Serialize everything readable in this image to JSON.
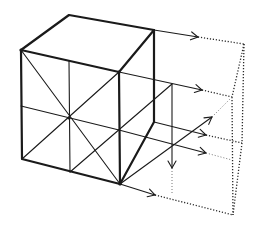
{
  "figure": {
    "ink_color": "#1a1a1a",
    "background": "#ffffff",
    "parts": {
      "cube": "solid cube with bold outline",
      "front_face_guides": "diagonals and midlines crossing at the face center",
      "projection_arrows": "arrows extending rightward from cube vertices",
      "ghost_outline": "dotted outline of the translated shape"
    }
  }
}
